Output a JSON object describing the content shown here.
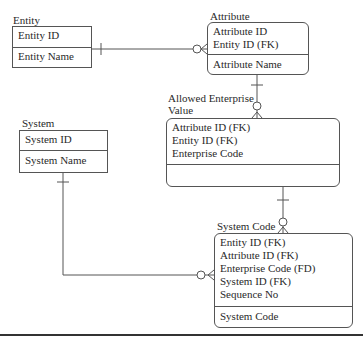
{
  "entities": {
    "entity": {
      "title": "Entity",
      "keys": [
        "Entity ID"
      ],
      "attributes": [
        "Entity Name"
      ]
    },
    "attribute": {
      "title": "Attribute",
      "keys": [
        "Attribute ID",
        "Entity ID (FK)"
      ],
      "attributes": [
        "Attribute Name"
      ]
    },
    "allowed_enterprise_value": {
      "title_line1": "Allowed Enterprise",
      "title_line2": "Value",
      "keys": [
        "Attribute ID (FK)",
        "Entity ID (FK)",
        "Enterprise Code"
      ],
      "attributes": []
    },
    "system": {
      "title": "System",
      "keys": [
        "System ID"
      ],
      "attributes": [
        "System Name"
      ]
    },
    "system_code": {
      "title": "System Code",
      "keys": [
        "Entity ID (FK)",
        "Attribute ID (FK)",
        "Enterprise Code (FD)",
        "System ID (FK)",
        "Sequence No"
      ],
      "attributes": [
        "System Code"
      ]
    }
  },
  "relationships": [
    {
      "from": "Entity",
      "to": "Attribute",
      "from_cardinality": "one",
      "to_cardinality": "zero-or-many"
    },
    {
      "from": "Attribute",
      "to": "Allowed Enterprise Value",
      "from_cardinality": "one",
      "to_cardinality": "zero-or-many"
    },
    {
      "from": "Allowed Enterprise Value",
      "to": "System Code",
      "from_cardinality": "one",
      "to_cardinality": "zero-or-many"
    },
    {
      "from": "System",
      "to": "System Code",
      "from_cardinality": "one",
      "to_cardinality": "zero-or-many"
    }
  ],
  "colors": {
    "line": "#555555",
    "text": "#2a2a2a",
    "background": "#ffffff"
  }
}
